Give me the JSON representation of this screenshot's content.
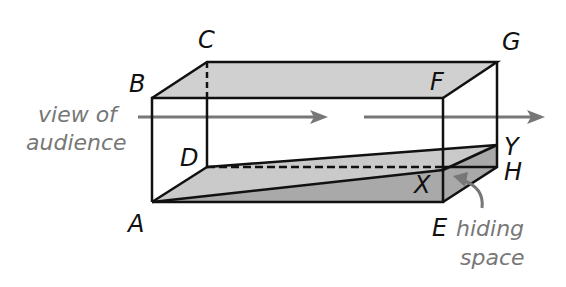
{
  "figure": {
    "vertices": {
      "A": "A",
      "B": "B",
      "C": "C",
      "D": "D",
      "E": "E",
      "F": "F",
      "G": "G",
      "H": "H",
      "X": "X",
      "Y": "Y"
    },
    "annotations": {
      "view_line1": "view of",
      "view_line2": "audience",
      "hiding_line1": "hiding",
      "hiding_line2": "space"
    },
    "colors": {
      "edge": "#111111",
      "top_face": "#d0d0d0",
      "mirror_plane": "#c8c8c8",
      "hidden_space": "#a9a9a9",
      "annotation": "#777777"
    }
  }
}
